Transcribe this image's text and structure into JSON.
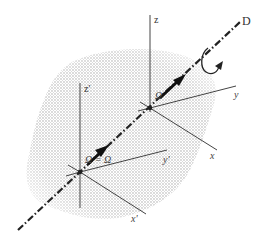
{
  "figure": {
    "colors": {
      "background": "#ffffff",
      "ink": "#222222",
      "axis_line": "#444444",
      "shading_dot": "#9a9a9a"
    },
    "axis_line_label": "D",
    "frame_fixed": {
      "z_label": "z",
      "y_label": "y",
      "x_label": "x"
    },
    "frame_moving": {
      "z_label": "z'",
      "y_label": "y'",
      "x_label": "x'"
    },
    "vector_labels": {
      "omega_upper": "Ω",
      "omega_lower": "Ω = Ω"
    },
    "icons": {
      "rotation": "curved-rotation-arrow-icon",
      "vector_arrow": "bold-arrow-icon"
    }
  }
}
